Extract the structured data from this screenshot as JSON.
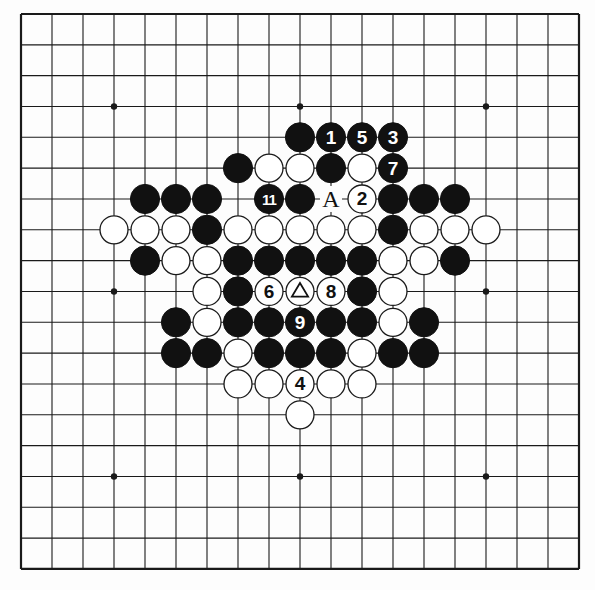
{
  "board": {
    "size": 19,
    "origin_x": 21,
    "origin_y": 14,
    "spacing_x": 31.0,
    "spacing_y": 30.83,
    "line_color": "#1a1a1a",
    "background": "#fdfdfd",
    "star_points": [
      [
        3,
        3
      ],
      [
        3,
        9
      ],
      [
        3,
        15
      ],
      [
        9,
        3
      ],
      [
        9,
        9
      ],
      [
        9,
        15
      ],
      [
        15,
        3
      ],
      [
        15,
        9
      ],
      [
        15,
        15
      ]
    ]
  },
  "stones": [
    {
      "row": 4,
      "col": 9,
      "color": "black",
      "label": ""
    },
    {
      "row": 4,
      "col": 10,
      "color": "black",
      "label": "1"
    },
    {
      "row": 4,
      "col": 11,
      "color": "black",
      "label": "5"
    },
    {
      "row": 4,
      "col": 12,
      "color": "black",
      "label": "3"
    },
    {
      "row": 5,
      "col": 7,
      "color": "black",
      "label": ""
    },
    {
      "row": 5,
      "col": 8,
      "color": "white",
      "label": ""
    },
    {
      "row": 5,
      "col": 9,
      "color": "white",
      "label": ""
    },
    {
      "row": 5,
      "col": 10,
      "color": "black",
      "label": ""
    },
    {
      "row": 5,
      "col": 11,
      "color": "white",
      "label": ""
    },
    {
      "row": 5,
      "col": 12,
      "color": "black",
      "label": "7"
    },
    {
      "row": 6,
      "col": 4,
      "color": "black",
      "label": ""
    },
    {
      "row": 6,
      "col": 5,
      "color": "black",
      "label": ""
    },
    {
      "row": 6,
      "col": 6,
      "color": "black",
      "label": ""
    },
    {
      "row": 6,
      "col": 8,
      "color": "black",
      "label": "11"
    },
    {
      "row": 6,
      "col": 9,
      "color": "black",
      "label": ""
    },
    {
      "row": 6,
      "col": 11,
      "color": "white",
      "label": "2"
    },
    {
      "row": 6,
      "col": 12,
      "color": "black",
      "label": ""
    },
    {
      "row": 6,
      "col": 13,
      "color": "black",
      "label": ""
    },
    {
      "row": 6,
      "col": 14,
      "color": "black",
      "label": ""
    },
    {
      "row": 7,
      "col": 3,
      "color": "white",
      "label": ""
    },
    {
      "row": 7,
      "col": 4,
      "color": "white",
      "label": ""
    },
    {
      "row": 7,
      "col": 5,
      "color": "white",
      "label": ""
    },
    {
      "row": 7,
      "col": 6,
      "color": "black",
      "label": ""
    },
    {
      "row": 7,
      "col": 7,
      "color": "white",
      "label": ""
    },
    {
      "row": 7,
      "col": 8,
      "color": "white",
      "label": ""
    },
    {
      "row": 7,
      "col": 9,
      "color": "white",
      "label": ""
    },
    {
      "row": 7,
      "col": 10,
      "color": "white",
      "label": ""
    },
    {
      "row": 7,
      "col": 11,
      "color": "white",
      "label": ""
    },
    {
      "row": 7,
      "col": 12,
      "color": "black",
      "label": ""
    },
    {
      "row": 7,
      "col": 13,
      "color": "white",
      "label": ""
    },
    {
      "row": 7,
      "col": 14,
      "color": "white",
      "label": ""
    },
    {
      "row": 7,
      "col": 15,
      "color": "white",
      "label": ""
    },
    {
      "row": 8,
      "col": 4,
      "color": "black",
      "label": ""
    },
    {
      "row": 8,
      "col": 5,
      "color": "white",
      "label": ""
    },
    {
      "row": 8,
      "col": 6,
      "color": "white",
      "label": ""
    },
    {
      "row": 8,
      "col": 7,
      "color": "black",
      "label": ""
    },
    {
      "row": 8,
      "col": 8,
      "color": "black",
      "label": ""
    },
    {
      "row": 8,
      "col": 9,
      "color": "black",
      "label": ""
    },
    {
      "row": 8,
      "col": 10,
      "color": "black",
      "label": ""
    },
    {
      "row": 8,
      "col": 11,
      "color": "black",
      "label": ""
    },
    {
      "row": 8,
      "col": 12,
      "color": "white",
      "label": ""
    },
    {
      "row": 8,
      "col": 13,
      "color": "white",
      "label": ""
    },
    {
      "row": 8,
      "col": 14,
      "color": "black",
      "label": ""
    },
    {
      "row": 9,
      "col": 6,
      "color": "white",
      "label": ""
    },
    {
      "row": 9,
      "col": 7,
      "color": "black",
      "label": ""
    },
    {
      "row": 9,
      "col": 8,
      "color": "white",
      "label": "6"
    },
    {
      "row": 9,
      "col": 9,
      "color": "white",
      "label": "△"
    },
    {
      "row": 9,
      "col": 10,
      "color": "white",
      "label": "8"
    },
    {
      "row": 9,
      "col": 11,
      "color": "black",
      "label": ""
    },
    {
      "row": 9,
      "col": 12,
      "color": "white",
      "label": ""
    },
    {
      "row": 10,
      "col": 5,
      "color": "black",
      "label": ""
    },
    {
      "row": 10,
      "col": 6,
      "color": "white",
      "label": ""
    },
    {
      "row": 10,
      "col": 7,
      "color": "black",
      "label": ""
    },
    {
      "row": 10,
      "col": 8,
      "color": "black",
      "label": ""
    },
    {
      "row": 10,
      "col": 9,
      "color": "black",
      "label": "9"
    },
    {
      "row": 10,
      "col": 10,
      "color": "black",
      "label": ""
    },
    {
      "row": 10,
      "col": 11,
      "color": "black",
      "label": ""
    },
    {
      "row": 10,
      "col": 12,
      "color": "white",
      "label": ""
    },
    {
      "row": 10,
      "col": 13,
      "color": "black",
      "label": ""
    },
    {
      "row": 11,
      "col": 5,
      "color": "black",
      "label": ""
    },
    {
      "row": 11,
      "col": 6,
      "color": "black",
      "label": ""
    },
    {
      "row": 11,
      "col": 7,
      "color": "white",
      "label": ""
    },
    {
      "row": 11,
      "col": 8,
      "color": "black",
      "label": ""
    },
    {
      "row": 11,
      "col": 9,
      "color": "black",
      "label": ""
    },
    {
      "row": 11,
      "col": 10,
      "color": "black",
      "label": ""
    },
    {
      "row": 11,
      "col": 11,
      "color": "white",
      "label": ""
    },
    {
      "row": 11,
      "col": 12,
      "color": "black",
      "label": ""
    },
    {
      "row": 11,
      "col": 13,
      "color": "black",
      "label": ""
    },
    {
      "row": 12,
      "col": 7,
      "color": "white",
      "label": ""
    },
    {
      "row": 12,
      "col": 8,
      "color": "white",
      "label": ""
    },
    {
      "row": 12,
      "col": 9,
      "color": "white",
      "label": "4"
    },
    {
      "row": 12,
      "col": 10,
      "color": "white",
      "label": ""
    },
    {
      "row": 12,
      "col": 11,
      "color": "white",
      "label": ""
    },
    {
      "row": 13,
      "col": 9,
      "color": "white",
      "label": ""
    }
  ],
  "annotations": [
    {
      "row": 6,
      "col": 10,
      "text": "A"
    }
  ]
}
